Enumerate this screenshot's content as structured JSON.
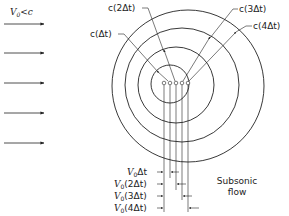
{
  "figure": {
    "condition_label": {
      "main": "V",
      "subscript": "0",
      "rest": "<c"
    },
    "flow_label": {
      "line1": "Subsonic",
      "line2": "flow"
    },
    "flow_arrows_count": 5,
    "colors": {
      "ink": "#222222",
      "background": "#ffffff"
    }
  },
  "wavefront_labels": [
    {
      "id": "c1",
      "text": "c(Δt)"
    },
    {
      "id": "c2",
      "text": "c(2Δt)"
    },
    {
      "id": "c3",
      "text": "c(3Δt)"
    },
    {
      "id": "c4",
      "text": "c(4Δt)"
    }
  ],
  "displacement_labels": [
    {
      "id": "v1",
      "prefix": "V",
      "subscript": "0",
      "text": "Δt"
    },
    {
      "id": "v2",
      "prefix": "V",
      "subscript": "0",
      "text": "(2Δt)"
    },
    {
      "id": "v3",
      "prefix": "V",
      "subscript": "0",
      "text": "(3Δt)"
    },
    {
      "id": "v4",
      "prefix": "V",
      "subscript": "0",
      "text": "(4Δt)"
    }
  ],
  "wavefronts": [
    {
      "name": "wavefront-1",
      "radius_label": "c(Δt)"
    },
    {
      "name": "wavefront-2",
      "radius_label": "c(2Δt)"
    },
    {
      "name": "wavefront-3",
      "radius_label": "c(3Δt)"
    },
    {
      "name": "wavefront-4",
      "radius_label": "c(4Δt)"
    }
  ],
  "emission_points_count": 5
}
